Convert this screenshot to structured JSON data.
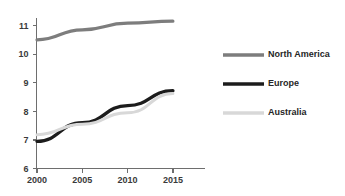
{
  "chart_data": {
    "type": "line",
    "title": "",
    "subtitle": "",
    "xlabel": "",
    "ylabel": "",
    "x": [
      2000,
      2005,
      2010,
      2015
    ],
    "categories": [
      "2000",
      "2005",
      "2010",
      "2015"
    ],
    "xlim": [
      1999,
      2017
    ],
    "ylim": [
      6,
      11.4
    ],
    "yticks": [
      6,
      7,
      8,
      9,
      10,
      11
    ],
    "ytick_labels": [
      "6",
      "7",
      "8",
      "9",
      "10",
      "11"
    ],
    "xticks": [
      2000,
      2005,
      2010,
      2015
    ],
    "xtick_labels": [
      "2000",
      "2005",
      "2010",
      "2015"
    ],
    "grid": false,
    "legend_position": "right",
    "series": [
      {
        "name": "North America",
        "color": "#7d7d7d",
        "line_width": 3.2,
        "values": [
          10.5,
          10.85,
          11.08,
          11.15
        ]
      },
      {
        "name": "Europe",
        "color": "#1c1c1c",
        "line_width": 3.4,
        "values": [
          6.95,
          7.6,
          8.2,
          8.72
        ]
      },
      {
        "name": "Australia",
        "color": "#d8d8d8",
        "line_width": 3.0,
        "values": [
          7.18,
          7.55,
          7.95,
          8.62
        ]
      }
    ]
  },
  "axes": {
    "axis_color": "#6e6e6e",
    "tick_label_color": "#3a3a3a"
  },
  "legend": {
    "entries": [
      {
        "label": "North America",
        "color": "#7d7d7d"
      },
      {
        "label": "Europe",
        "color": "#1c1c1c"
      },
      {
        "label": "Australia",
        "color": "#d8d8d8"
      }
    ]
  }
}
